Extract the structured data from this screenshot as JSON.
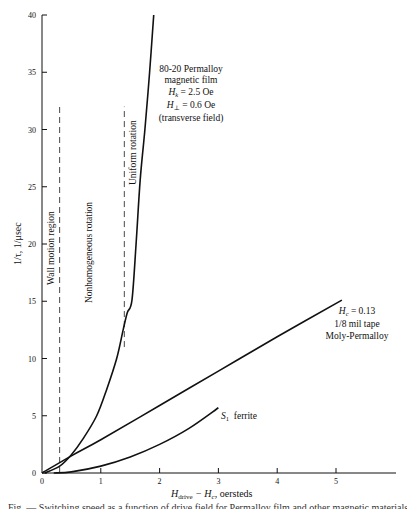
{
  "chart_data": {
    "type": "line",
    "title": "",
    "xlabel": "H_drive − H_c, oersteds",
    "xlabel_parts": {
      "main": "H",
      "sub": "drive",
      "mid": " − H",
      "sub2": "c",
      "tail": ", oersteds"
    },
    "ylabel": "1/τ, 1/μsec",
    "xlim": [
      0,
      6
    ],
    "ylim": [
      0,
      40
    ],
    "x_ticks": [
      0,
      1,
      2,
      3,
      4,
      5
    ],
    "x_tick_labels": [
      "0",
      "1",
      "2",
      "3",
      "4",
      "5"
    ],
    "y_ticks": [
      0,
      5,
      10,
      15,
      20,
      25,
      30,
      35,
      40
    ],
    "y_tick_labels": [
      "0",
      "5",
      "10",
      "15",
      "20",
      "25",
      "30",
      "35",
      "40"
    ],
    "grid": false,
    "legend": "none (inline annotations)",
    "series": [
      {
        "name": "80-20 Permalloy magnetic film",
        "style": "solid",
        "x": [
          0.05,
          0.3,
          0.5,
          0.7,
          0.93,
          1.1,
          1.27,
          1.38,
          1.45,
          1.53,
          1.6,
          1.67,
          1.75,
          1.83,
          1.9
        ],
        "y": [
          0,
          0.6,
          1.6,
          3.0,
          5.0,
          7.3,
          10.0,
          12.5,
          14.0,
          15.1,
          20.0,
          25.6,
          30.0,
          35.0,
          40.0
        ]
      },
      {
        "name": "1/8 mil tape Moly-Permalloy (H_c = 0.13)",
        "style": "solid",
        "x": [
          0.0,
          0.5,
          1.0,
          2.0,
          3.0,
          4.0,
          5.1
        ],
        "y": [
          0.0,
          1.5,
          2.9,
          5.9,
          8.9,
          11.9,
          15.1
        ]
      },
      {
        "name": "S1 ferrite",
        "style": "solid",
        "x": [
          0.2,
          0.5,
          1.0,
          1.5,
          2.0,
          2.5,
          3.0
        ],
        "y": [
          0.0,
          0.1,
          0.6,
          1.4,
          2.5,
          3.9,
          5.7
        ]
      }
    ],
    "reference_lines": [
      {
        "name": "Wall motion boundary",
        "style": "dashed",
        "x": 0.3,
        "y_range": [
          0,
          32
        ]
      },
      {
        "name": "Uniform rotation boundary",
        "style": "dashed",
        "x": 1.4,
        "y_range": [
          11,
          32
        ]
      }
    ],
    "annotations": {
      "permalloy": [
        "80-20 Permalloy",
        "magnetic film",
        "Hk = 2.5 Oe",
        "H⊥ = 0.6 Oe",
        "(transverse field)"
      ],
      "moly": [
        "Hc = 0.13",
        "1/8 mil tape",
        "Moly-Permalloy"
      ],
      "ferrite": "S1 ferrite",
      "regions": [
        "Wall motion region",
        "Nonhomogeneous rotation",
        "Uniform rotation"
      ]
    }
  },
  "labels": {
    "wall_motion": "Wall motion region",
    "nonhomogeneous": "Nonhomogeneous rotation",
    "uniform": "Uniform rotation",
    "perm_l1": "80-20 Permalloy",
    "perm_l2": "magnetic film",
    "perm_hk_sym": "H",
    "perm_hk_sub": "k",
    "perm_hk_val": " = 2.5 Oe",
    "perm_hp_sym": "H",
    "perm_hp_sub": "⊥",
    "perm_hp_val": " = 0.6 Oe",
    "perm_l5": "(transverse field)",
    "moly_hc_sym": "H",
    "moly_hc_sub": "c",
    "moly_hc_val": " = 0.13",
    "moly_l2": "1/8 mil tape",
    "moly_l3": "Moly-Permalloy",
    "ferrite_sym": "S",
    "ferrite_sub": "1",
    "ferrite_txt": "  ferrite",
    "ylabel": "1/τ, 1/μsec",
    "x_main": "H",
    "x_sub": "drive",
    "x_mid": " − H",
    "x_sub2": "c",
    "x_tail": ", oersteds",
    "caption_fragment": "Fig. — Switching speed as a function of drive field for Permalloy film and other magnetic materials"
  },
  "colors": {
    "ink": "#111111",
    "background": "#ffffff"
  }
}
